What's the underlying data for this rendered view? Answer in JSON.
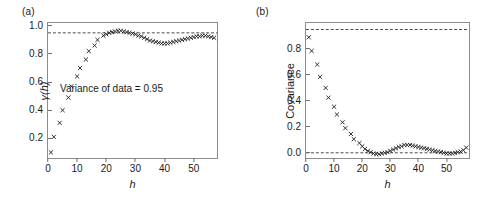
{
  "figure": {
    "background": "#ffffff",
    "marker_color": "#1a1a1a",
    "axis_color": "#8c8c8c",
    "dash_color": "#1a1a1a"
  },
  "panels": [
    {
      "tag": "(a)",
      "xlabel": "h",
      "ylabel": "γ(h)",
      "annotation": "Variance of data = 0.95",
      "yticks": [
        "0.2",
        "0.4",
        "0.6",
        "0.8",
        "1.0"
      ],
      "ytick_values": [
        0.2,
        0.4,
        0.6,
        0.8,
        1.0
      ],
      "xticks": [
        "0",
        "10",
        "20",
        "30",
        "40",
        "50"
      ],
      "xtick_values": [
        0,
        10,
        20,
        30,
        40,
        50
      ]
    },
    {
      "tag": "(b)",
      "xlabel": "h",
      "ylabel": "Covariance",
      "annotation": "",
      "yticks": [
        "0.0",
        "0.2",
        "0.4",
        "0.6",
        "0.8"
      ],
      "ytick_values": [
        0.0,
        0.2,
        0.4,
        0.6,
        0.8
      ],
      "xticks": [
        "0",
        "10",
        "20",
        "30",
        "40",
        "50"
      ],
      "xtick_values": [
        0,
        10,
        20,
        30,
        40,
        50
      ]
    }
  ],
  "chart_data": [
    {
      "type": "scatter",
      "title": "(a)",
      "xlabel": "h",
      "ylabel": "γ(h)",
      "marker": "x",
      "grid": false,
      "legend": null,
      "xlim": [
        0,
        58
      ],
      "ylim": [
        0.06,
        1.02
      ],
      "annotations": [
        {
          "text": "Variance of data = 0.95",
          "x": 27,
          "y": 0.45
        }
      ],
      "reference_lines": [
        {
          "orientation": "horizontal",
          "value": 0.95,
          "style": "dashed",
          "label": "Variance of data = 0.95"
        }
      ],
      "x": [
        1,
        2,
        4,
        5,
        7,
        8,
        10,
        11,
        13,
        14,
        16,
        17,
        19,
        20,
        21,
        22,
        23,
        24,
        25,
        26,
        27,
        28,
        29,
        30,
        31,
        32,
        33,
        34,
        35,
        36,
        37,
        38,
        39,
        40,
        41,
        42,
        43,
        44,
        45,
        46,
        47,
        48,
        49,
        50,
        51,
        52,
        53,
        54,
        55,
        56,
        57
      ],
      "values": [
        0.1,
        0.21,
        0.31,
        0.4,
        0.49,
        0.57,
        0.64,
        0.7,
        0.76,
        0.82,
        0.86,
        0.9,
        0.93,
        0.94,
        0.95,
        0.955,
        0.96,
        0.965,
        0.965,
        0.96,
        0.955,
        0.95,
        0.945,
        0.94,
        0.93,
        0.925,
        0.915,
        0.905,
        0.895,
        0.89,
        0.885,
        0.88,
        0.875,
        0.875,
        0.875,
        0.88,
        0.885,
        0.89,
        0.895,
        0.9,
        0.905,
        0.91,
        0.915,
        0.92,
        0.925,
        0.925,
        0.93,
        0.93,
        0.925,
        0.92,
        0.915
      ]
    },
    {
      "type": "scatter",
      "title": "(b)",
      "xlabel": "h",
      "ylabel": "Covariance",
      "marker": "x",
      "grid": false,
      "legend": null,
      "xlim": [
        0,
        58
      ],
      "ylim": [
        -0.04,
        1.0
      ],
      "annotations": [],
      "reference_lines": [
        {
          "orientation": "horizontal",
          "value": 0.95,
          "style": "dashed",
          "label": "Variance of data = 0.95"
        },
        {
          "orientation": "horizontal",
          "value": 0.0,
          "style": "dashed",
          "label": "Zero covariance"
        }
      ],
      "x": [
        1,
        2,
        4,
        5,
        7,
        8,
        10,
        11,
        13,
        14,
        16,
        17,
        19,
        20,
        21,
        22,
        23,
        24,
        25,
        26,
        27,
        28,
        29,
        30,
        31,
        32,
        33,
        34,
        35,
        36,
        37,
        38,
        39,
        40,
        41,
        42,
        43,
        44,
        45,
        46,
        47,
        48,
        49,
        50,
        51,
        52,
        53,
        54,
        55,
        56,
        57
      ],
      "values": [
        0.89,
        0.785,
        0.68,
        0.585,
        0.5,
        0.425,
        0.355,
        0.295,
        0.235,
        0.19,
        0.145,
        0.105,
        0.075,
        0.05,
        0.03,
        0.015,
        0.005,
        -0.005,
        -0.01,
        -0.01,
        -0.005,
        0.0,
        0.005,
        0.015,
        0.025,
        0.035,
        0.045,
        0.05,
        0.06,
        0.06,
        0.06,
        0.055,
        0.05,
        0.045,
        0.04,
        0.035,
        0.03,
        0.025,
        0.02,
        0.015,
        0.01,
        0.005,
        0.0,
        -0.005,
        -0.005,
        -0.005,
        0.0,
        0.005,
        0.01,
        0.02,
        0.04
      ]
    }
  ]
}
